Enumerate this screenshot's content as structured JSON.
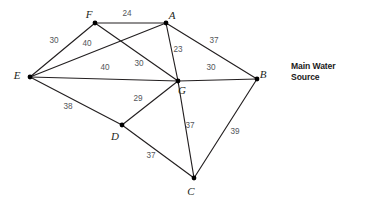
{
  "diagram": {
    "type": "weighted-undirected-graph",
    "caption": "Main Water Source",
    "nodes": [
      {
        "id": "A",
        "label": "A",
        "x": 166,
        "y": 23,
        "label_x": 172,
        "label_y": 19
      },
      {
        "id": "B",
        "label": "B",
        "x": 257,
        "y": 79,
        "label_x": 263,
        "label_y": 78
      },
      {
        "id": "C",
        "label": "C",
        "x": 194,
        "y": 178,
        "label_x": 191,
        "label_y": 195
      },
      {
        "id": "D",
        "label": "D",
        "x": 122,
        "y": 125,
        "label_x": 115,
        "label_y": 140
      },
      {
        "id": "E",
        "label": "E",
        "x": 30,
        "y": 77,
        "label_x": 17,
        "label_y": 79
      },
      {
        "id": "F",
        "label": "F",
        "x": 95,
        "y": 23,
        "label_x": 89,
        "label_y": 18
      },
      {
        "id": "G",
        "label": "G",
        "x": 178,
        "y": 81,
        "label_x": 182,
        "label_y": 94
      }
    ],
    "edges": [
      {
        "from": "F",
        "to": "A",
        "weight": "24",
        "wx": 127,
        "wy": 16
      },
      {
        "from": "E",
        "to": "F",
        "weight": "30",
        "wx": 54,
        "wy": 43
      },
      {
        "from": "F",
        "to": "G",
        "weight": "40",
        "wx": 87,
        "wy": 46
      },
      {
        "from": "A",
        "to": "E",
        "weight": "30",
        "wx": 139,
        "wy": 66
      },
      {
        "from": "A",
        "to": "G",
        "weight": "23",
        "wx": 178,
        "wy": 52
      },
      {
        "from": "A",
        "to": "B",
        "weight": "37",
        "wx": 214,
        "wy": 43
      },
      {
        "from": "E",
        "to": "G",
        "weight": "40",
        "wx": 105,
        "wy": 70
      },
      {
        "from": "E",
        "to": "D",
        "weight": "38",
        "wx": 68,
        "wy": 109
      },
      {
        "from": "G",
        "to": "B",
        "weight": "30",
        "wx": 211,
        "wy": 70
      },
      {
        "from": "D",
        "to": "G",
        "weight": "29",
        "wx": 138,
        "wy": 101
      },
      {
        "from": "G",
        "to": "C",
        "weight": "37",
        "wx": 190,
        "wy": 128
      },
      {
        "from": "D",
        "to": "C",
        "weight": "37",
        "wx": 151,
        "wy": 158
      },
      {
        "from": "B",
        "to": "C",
        "weight": "39",
        "wx": 235,
        "wy": 134
      }
    ],
    "colors": {
      "edge": "#231f20",
      "node": "#000000",
      "weight_text": "#54565a",
      "caption_text": "#1a1a1a",
      "background": "#ffffff"
    }
  }
}
